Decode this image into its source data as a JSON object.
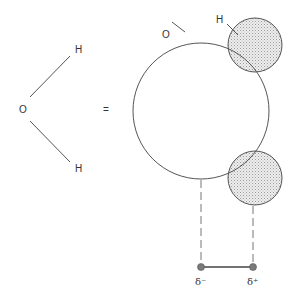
{
  "diagram": {
    "left": {
      "oxygen_label": "O",
      "hydrogen_top_label": "H",
      "hydrogen_bottom_label": "H"
    },
    "equals": "=",
    "right": {
      "oxygen_label": "O",
      "hydrogen_label": "H",
      "dipole": {
        "negative_label": "δ⁻",
        "positive_label": "δ⁺"
      }
    },
    "colors": {
      "stroke": "#555555",
      "stipple": "#d8d8d8",
      "dot": "#7a7a7a"
    }
  }
}
